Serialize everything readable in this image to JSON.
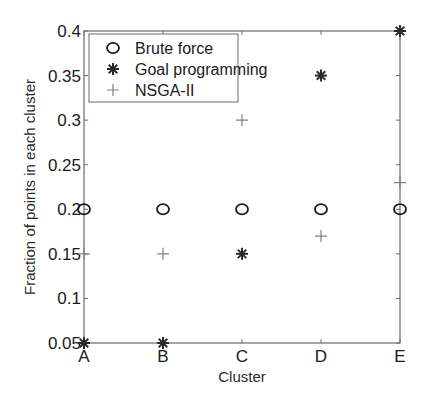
{
  "chart_data": {
    "type": "scatter",
    "title": "",
    "xlabel": "Cluster",
    "ylabel": "Fraction of points in each cluster",
    "categories": [
      "A",
      "B",
      "C",
      "D",
      "E"
    ],
    "ylim": [
      0.05,
      0.4
    ],
    "yticks": [
      "0.05",
      "0.1",
      "0.15",
      "0.2",
      "0.25",
      "0.3",
      "0.35",
      "0.4"
    ],
    "grid": false,
    "legend_position": "upper left",
    "series": [
      {
        "name": "Brute force",
        "marker": "circle",
        "color": "#1a1a1a",
        "values": [
          0.2,
          0.2,
          0.2,
          0.2,
          0.2
        ]
      },
      {
        "name": "Goal programming",
        "marker": "asterisk",
        "color": "#2a2a2a",
        "values": [
          0.05,
          0.05,
          0.15,
          0.35,
          0.4
        ]
      },
      {
        "name": "NSGA-II",
        "marker": "plus",
        "color": "#808080",
        "values": [
          0.15,
          0.15,
          0.3,
          0.17,
          0.23
        ]
      }
    ]
  }
}
